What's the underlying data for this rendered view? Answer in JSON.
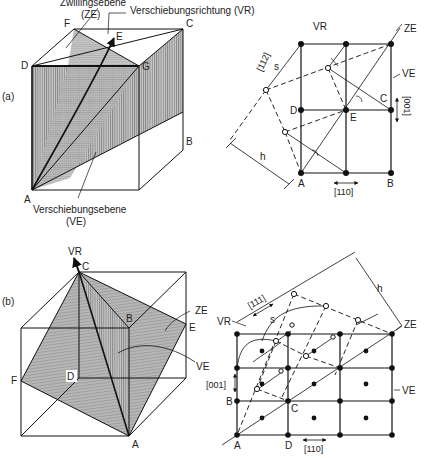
{
  "panels": [
    {
      "id": "a",
      "label": "(a)",
      "cube_labels": {
        "twin_plane_title": "Zwillingsebene",
        "twin_plane_abbr": "(ZE)",
        "shear_direction": "Verschiebungsrichtung (VR)",
        "shear_plane_title": "Verschiebungsebene",
        "shear_plane_abbr": "(VE)",
        "points": {
          "A": "A",
          "B": "B",
          "C": "C",
          "D": "D",
          "E": "E",
          "F": "F",
          "G": "G"
        }
      },
      "lattice_labels": {
        "VR": "VR",
        "ZE": "ZE",
        "VE": "VE",
        "direction_shear": "[112]",
        "s": "s",
        "h": "h",
        "dir_vertical": "[001]",
        "dir_horizontal": "[110]",
        "points": {
          "A": "A",
          "B": "B",
          "C": "C",
          "D": "D",
          "E": "E"
        }
      }
    },
    {
      "id": "b",
      "label": "(b)",
      "cube_labels": {
        "VR": "VR",
        "ZE": "ZE",
        "VE": "VE",
        "points": {
          "A": "A",
          "B": "B",
          "C": "C",
          "D": "D",
          "E": "E",
          "F": "F"
        }
      },
      "lattice_labels": {
        "VR": "VR",
        "ZE": "ZE",
        "VE": "VE",
        "direction_shear": "[111]",
        "s": "s",
        "h": "h",
        "dir_vertical": "[001]",
        "dir_horizontal": "[110]",
        "points": {
          "A": "A",
          "B": "B",
          "C": "C",
          "D": "D"
        }
      }
    }
  ]
}
